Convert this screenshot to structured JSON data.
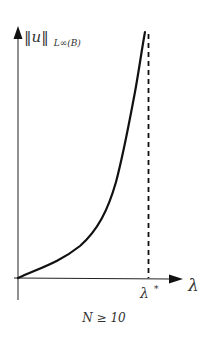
{
  "diagram": {
    "type": "bifurcation-sketch",
    "y_axis": {
      "label_main": "‖u‖",
      "label_sub": "L∞(B)"
    },
    "x_axis": {
      "label": "λ"
    },
    "critical_value": {
      "label": "λ",
      "superscript": "*"
    },
    "caption": "N ≥ 10",
    "colors": {
      "stroke": "#111111",
      "text": "#333333",
      "background": "#ffffff"
    }
  }
}
